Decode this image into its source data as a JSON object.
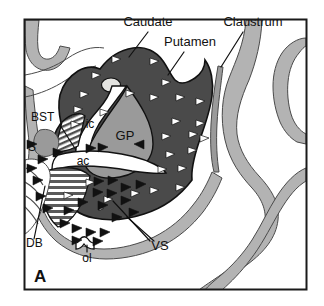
{
  "figure": {
    "panel_letter": "A",
    "frame": {
      "x": 24,
      "y": 19,
      "width": 283,
      "height": 271
    }
  },
  "palette": {
    "background": "#ffffff",
    "frame_stroke": "#1a1a1a",
    "striatum_dark": "#4a4a4a",
    "pallidum_mid": "#9a9a9a",
    "cortex_ribbon": "#b3b3b3",
    "white_matter": "#ffffff",
    "outline": "#1a1a1a",
    "arrow_white": "#ffffff",
    "arrow_black": "#111111",
    "text": "#111111"
  },
  "labels": [
    {
      "id": "caudate",
      "text": "Caudate",
      "x": 148,
      "y": 26,
      "size": 13,
      "anchor": "middle",
      "leader": [
        [
          148,
          30
        ],
        [
          129,
          56
        ]
      ]
    },
    {
      "id": "putamen",
      "text": "Putamen",
      "x": 190,
      "y": 46,
      "size": 13,
      "anchor": "middle",
      "leader": [
        [
          186,
          50
        ],
        [
          170,
          74
        ]
      ]
    },
    {
      "id": "claustrum",
      "text": "Claustrum",
      "x": 253,
      "y": 26,
      "size": 13,
      "anchor": "middle",
      "leader": [
        [
          243,
          30
        ],
        [
          221,
          66
        ]
      ]
    },
    {
      "id": "bst",
      "text": "BST",
      "x": 44,
      "y": 121,
      "size": 12,
      "anchor": "start",
      "leader": [
        [
          59,
          125
        ],
        [
          75,
          150
        ]
      ]
    },
    {
      "id": "s",
      "text": "S",
      "x": 30,
      "y": 150,
      "size": 12,
      "anchor": "start",
      "leader": null
    },
    {
      "id": "ic",
      "text": "ic",
      "x": 89,
      "y": 125,
      "size": 12,
      "anchor": "middle",
      "leader": null
    },
    {
      "id": "gp",
      "text": "GP",
      "x": 125,
      "y": 139,
      "size": 13,
      "anchor": "middle",
      "leader": null
    },
    {
      "id": "ac",
      "text": "ac",
      "x": 83,
      "y": 163,
      "size": 12,
      "anchor": "middle",
      "leader": null
    },
    {
      "id": "db",
      "text": "DB",
      "x": 27,
      "y": 246,
      "size": 12,
      "anchor": "start",
      "leader": [
        [
          34,
          238
        ],
        [
          44,
          187
        ]
      ]
    },
    {
      "id": "ol",
      "text": "ol",
      "x": 87,
      "y": 259,
      "size": 12,
      "anchor": "middle",
      "leader": [
        [
          87,
          250
        ],
        [
          87,
          243
        ]
      ]
    },
    {
      "id": "vs",
      "text": "VS",
      "x": 158,
      "y": 248,
      "size": 13,
      "anchor": "middle",
      "leader": [
        [
          152,
          242
        ],
        [
          113,
          200
        ]
      ]
    },
    {
      "id": "vs2",
      "text": "",
      "x": 0,
      "y": 0,
      "size": 0,
      "anchor": "middle",
      "leader": [
        [
          156,
          242
        ],
        [
          126,
          216
        ]
      ]
    },
    {
      "id": "panel-a",
      "text": "A",
      "x": 35,
      "y": 281,
      "size": 16,
      "anchor": "start",
      "leader": null
    }
  ],
  "structures": [
    {
      "id": "caudate-putamen",
      "name": "Caudate / Putamen (dorsal striatum)",
      "fill": "#4a4a4a",
      "marker": "white-arrowheads"
    },
    {
      "id": "globus-pallidus",
      "name": "Globus pallidus (GP)",
      "fill": "#9a9a9a",
      "marker": "none"
    },
    {
      "id": "internal-capsule",
      "name": "Internal capsule (ic)",
      "fill": "#ffffff",
      "marker": "none"
    },
    {
      "id": "anterior-commissure",
      "name": "Anterior commissure (ac)",
      "fill": "#ffffff",
      "marker": "none"
    },
    {
      "id": "ventral-striatum",
      "name": "Ventral striatum (VS)",
      "fill": "#4a4a4a",
      "marker": "black-arrowheads"
    },
    {
      "id": "bst-hatched",
      "name": "Bed nucleus of the stria terminalis (BST)",
      "fill": "hatched",
      "marker": "none"
    },
    {
      "id": "claustrum-sliver",
      "name": "Claustrum",
      "fill": "#9a9a9a",
      "marker": "none"
    },
    {
      "id": "cortical-ribbon",
      "name": "Cortical gray matter ribbon",
      "fill": "#b3b3b3",
      "marker": "none"
    },
    {
      "id": "diagonal-band",
      "name": "Diagonal band (DB)",
      "fill": "#b3b3b3",
      "marker": "none"
    },
    {
      "id": "olfactory-tubercle",
      "name": "Olfactory tubercle / lateral olfactory tract (ol)",
      "fill": "#ffffff",
      "marker": "none"
    }
  ]
}
